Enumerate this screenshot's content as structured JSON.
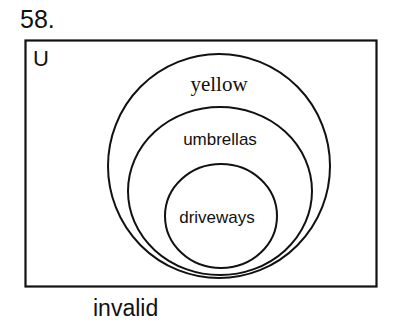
{
  "problem": {
    "number": "58."
  },
  "diagram": {
    "universe_label": "U",
    "sets": [
      {
        "label": "yellow",
        "contains": "umbrellas"
      },
      {
        "label": "umbrellas",
        "contains": "driveways"
      },
      {
        "label": "driveways"
      }
    ],
    "stroke_color": "#111111",
    "background_color": "#ffffff"
  },
  "caption": "invalid"
}
